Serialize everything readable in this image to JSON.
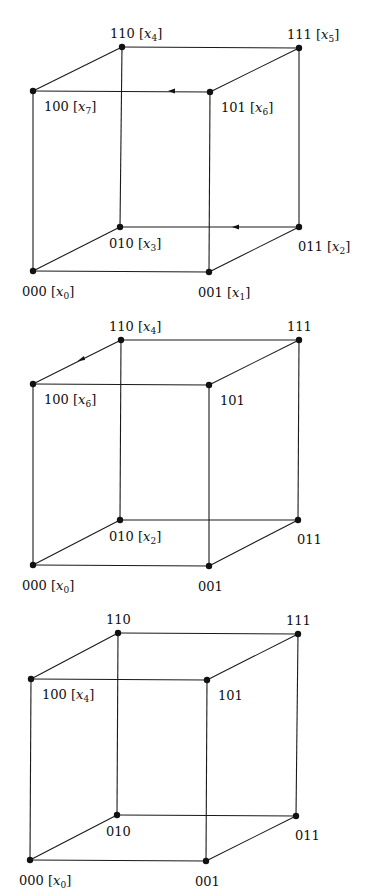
{
  "diagram": {
    "colors": {
      "background": "#ffffff",
      "ink": "#111111"
    },
    "cubes": [
      {
        "id": "cube-1",
        "vertices": {
          "110": {
            "x": 122,
            "y": 47,
            "code": "110",
            "var": "x",
            "sub": "4"
          },
          "111": {
            "x": 299,
            "y": 48,
            "code": "111",
            "var": "x",
            "sub": "5"
          },
          "100": {
            "x": 33,
            "y": 91,
            "code": "100",
            "var": "x",
            "sub": "7"
          },
          "101": {
            "x": 210,
            "y": 92,
            "code": "101",
            "var": "x",
            "sub": "6"
          },
          "010": {
            "x": 120,
            "y": 227,
            "code": "010",
            "var": "x",
            "sub": "3"
          },
          "011": {
            "x": 299,
            "y": 227,
            "code": "011",
            "var": "x",
            "sub": "2"
          },
          "000": {
            "x": 33,
            "y": 271,
            "code": "000",
            "var": "x",
            "sub": "0"
          },
          "001": {
            "x": 209,
            "y": 272,
            "code": "001",
            "var": "x",
            "sub": "1"
          }
        },
        "arrows": [
          {
            "edge": "101-100",
            "x": 172,
            "y": 91,
            "direction": "left"
          },
          {
            "edge": "011-010",
            "x": 236,
            "y": 227,
            "direction": "left"
          }
        ]
      },
      {
        "id": "cube-2",
        "vertices": {
          "110": {
            "x": 121,
            "y": 340,
            "code": "110",
            "var": "x",
            "sub": "4"
          },
          "111": {
            "x": 299,
            "y": 340,
            "code": "111"
          },
          "100": {
            "x": 33,
            "y": 384,
            "code": "100",
            "var": "x",
            "sub": "6"
          },
          "101": {
            "x": 209,
            "y": 385,
            "code": "101"
          },
          "010": {
            "x": 120,
            "y": 520,
            "code": "010",
            "var": "x",
            "sub": "2"
          },
          "011": {
            "x": 298,
            "y": 520,
            "code": "011"
          },
          "000": {
            "x": 33,
            "y": 565,
            "code": "000",
            "var": "x",
            "sub": "0"
          },
          "001": {
            "x": 209,
            "y": 566,
            "code": "001"
          }
        },
        "arrows": [
          {
            "edge": "110-100",
            "x": 81,
            "y": 359,
            "direction": "down-left"
          }
        ]
      },
      {
        "id": "cube-3",
        "vertices": {
          "110": {
            "x": 118,
            "y": 633,
            "code": "110"
          },
          "111": {
            "x": 298,
            "y": 634,
            "code": "111"
          },
          "100": {
            "x": 31,
            "y": 679,
            "code": "100",
            "var": "x",
            "sub": "4"
          },
          "101": {
            "x": 207,
            "y": 680,
            "code": "101"
          },
          "010": {
            "x": 117,
            "y": 815,
            "code": "010"
          },
          "011": {
            "x": 296,
            "y": 816,
            "code": "011"
          },
          "000": {
            "x": 30,
            "y": 860,
            "code": "000",
            "var": "x",
            "sub": "0"
          },
          "001": {
            "x": 206,
            "y": 861,
            "code": "001"
          }
        },
        "arrows": []
      }
    ]
  }
}
